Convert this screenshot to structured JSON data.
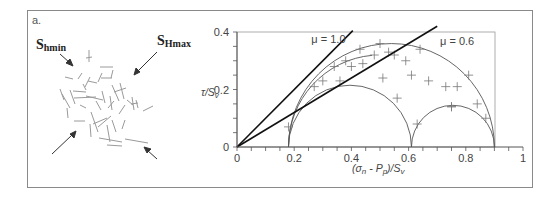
{
  "panel": {
    "label": "a.",
    "frame_color": "#888888"
  },
  "left_diagram": {
    "shmin_label_main": "S",
    "shmin_label_sub": "hmin",
    "shmax_label_main": "S",
    "shmax_label_sub": "Hmax",
    "fracture_color": "#9a9a9a",
    "arrow_color": "#333333"
  },
  "chart_data": {
    "type": "scatter",
    "title": "",
    "xlabel": "(σn - Pp)/Sv",
    "ylabel": "τ/Sv",
    "xlim": [
      0,
      1
    ],
    "ylim": [
      0,
      0.4
    ],
    "x_ticks": [
      "0",
      "0.2",
      "0.4",
      "0.6",
      "0.8",
      "1"
    ],
    "y_ticks": [
      "0",
      "0.2",
      "0.4"
    ],
    "grid": false,
    "legend": null,
    "annotations": [
      {
        "text": "μ = 1.0",
        "x": 0.26,
        "y": 0.375
      },
      {
        "text": "μ = 0.6",
        "x": 0.71,
        "y": 0.37
      }
    ],
    "lines": [
      {
        "name": "μ = 1.0",
        "slope": 1.0,
        "intercept": 0,
        "color": "#111111"
      },
      {
        "name": "μ = 0.6",
        "slope": 0.6,
        "intercept": 0,
        "color": "#111111"
      }
    ],
    "mohr_circles": [
      {
        "name": "outer",
        "sigma3": 0.18,
        "sigma1": 0.9
      },
      {
        "name": "inner-left",
        "sigma3": 0.18,
        "sigma1": 0.61
      },
      {
        "name": "inner-right",
        "sigma3": 0.61,
        "sigma1": 0.9
      },
      {
        "name": "partial-arc",
        "center": 0.5,
        "radius": 0.32,
        "from_deg": 180,
        "to_deg": 95
      }
    ],
    "points": [
      {
        "x": 0.18,
        "y": 0.07
      },
      {
        "x": 0.27,
        "y": 0.21
      },
      {
        "x": 0.3,
        "y": 0.23
      },
      {
        "x": 0.34,
        "y": 0.28
      },
      {
        "x": 0.36,
        "y": 0.23
      },
      {
        "x": 0.38,
        "y": 0.3
      },
      {
        "x": 0.4,
        "y": 0.28
      },
      {
        "x": 0.43,
        "y": 0.34
      },
      {
        "x": 0.44,
        "y": 0.29
      },
      {
        "x": 0.48,
        "y": 0.32
      },
      {
        "x": 0.5,
        "y": 0.36
      },
      {
        "x": 0.51,
        "y": 0.24
      },
      {
        "x": 0.53,
        "y": 0.33
      },
      {
        "x": 0.55,
        "y": 0.32
      },
      {
        "x": 0.56,
        "y": 0.17
      },
      {
        "x": 0.59,
        "y": 0.3
      },
      {
        "x": 0.61,
        "y": 0.25
      },
      {
        "x": 0.63,
        "y": 0.08
      },
      {
        "x": 0.64,
        "y": 0.34
      },
      {
        "x": 0.67,
        "y": 0.23
      },
      {
        "x": 0.73,
        "y": 0.21
      },
      {
        "x": 0.75,
        "y": 0.14
      },
      {
        "x": 0.77,
        "y": 0.21
      },
      {
        "x": 0.81,
        "y": 0.25
      },
      {
        "x": 0.75,
        "y": 0.14
      },
      {
        "x": 0.84,
        "y": 0.15
      },
      {
        "x": 0.87,
        "y": 0.1
      }
    ],
    "colors": {
      "axis": "#555555",
      "circle": "#555555",
      "points": "#777777"
    }
  }
}
